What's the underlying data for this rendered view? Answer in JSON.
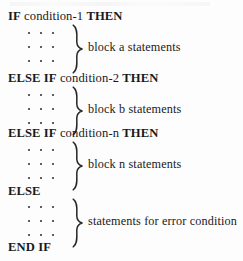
{
  "figure": {
    "kind": "pseudocode-listing",
    "ink_color": "#1a1a1a",
    "background_color": "#fdfdfd",
    "ellipsis_glyph": "·",
    "brace_glyph": "}",
    "lines": [
      {
        "id": "if-condition-1",
        "tokens": [
          {
            "text": "IF",
            "bold": true
          },
          {
            "text": "condition-1",
            "bold": false
          },
          {
            "text": "THEN",
            "bold": true
          }
        ],
        "full_text": "IF condition-1 THEN"
      },
      {
        "id": "else-if-condition-2",
        "tokens": [
          {
            "text": "ELSE",
            "bold": true
          },
          {
            "text": "IF",
            "bold": true
          },
          {
            "text": "condition-2",
            "bold": false
          },
          {
            "text": "THEN",
            "bold": true
          }
        ],
        "full_text": "ELSE IF condition-2 THEN"
      },
      {
        "id": "else-if-condition-n",
        "tokens": [
          {
            "text": "ELSE",
            "bold": true
          },
          {
            "text": "IF",
            "bold": true
          },
          {
            "text": "condition-n",
            "bold": false
          },
          {
            "text": "THEN",
            "bold": true
          }
        ],
        "full_text": "ELSE IF condition-n THEN"
      },
      {
        "id": "else",
        "tokens": [
          {
            "text": "ELSE",
            "bold": true
          }
        ],
        "full_text": "ELSE"
      },
      {
        "id": "end-if",
        "tokens": [
          {
            "text": "END",
            "bold": true
          },
          {
            "text": "IF",
            "bold": true
          }
        ],
        "full_text": "END IF"
      }
    ],
    "blocks": [
      {
        "id": "block-a",
        "annotation": "block a statements"
      },
      {
        "id": "block-b",
        "annotation": "block b statements"
      },
      {
        "id": "block-n",
        "annotation": "block n statements"
      },
      {
        "id": "block-error",
        "annotation": "statements for error condition"
      }
    ]
  }
}
